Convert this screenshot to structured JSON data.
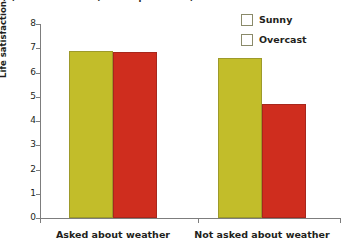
{
  "chart_data": {
    "type": "bar",
    "title": "(b) Life satisfaction (on a 10-point scale)",
    "xlabel": "",
    "ylabel": "Life satisfaction",
    "ylim": [
      0,
      8
    ],
    "yticks": [
      "0",
      "1",
      "2",
      "3",
      "4",
      "5",
      "6",
      "7",
      "8"
    ],
    "grid": false,
    "legend_position": "top-right",
    "categories": [
      "Asked about weather",
      "Not asked about weather"
    ],
    "series": [
      {
        "name": "Sunny",
        "color": "#c2bd2a",
        "values": [
          6.9,
          6.6
        ]
      },
      {
        "name": "Overcast",
        "color": "#cf2d1e",
        "values": [
          6.85,
          4.7
        ]
      }
    ]
  }
}
